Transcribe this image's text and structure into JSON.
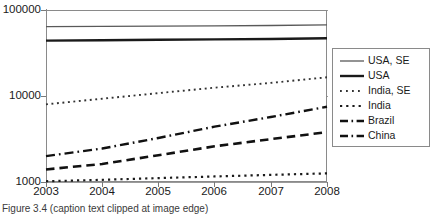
{
  "chart_data": {
    "type": "line",
    "title": "",
    "xlabel": "",
    "ylabel": "",
    "x": [
      2003,
      2004,
      2005,
      2006,
      2007,
      2008
    ],
    "xlim": [
      2003,
      2008
    ],
    "ylim": [
      1000,
      100000
    ],
    "yscale": "log",
    "ytick_labels": [
      "1000",
      "10000",
      "100000"
    ],
    "ytick_values": [
      1000,
      10000,
      100000
    ],
    "xtick_labels": [
      "2003",
      "2004",
      "2005",
      "2006",
      "2007",
      "2008"
    ],
    "grid": true,
    "legend_position": "right",
    "series": [
      {
        "name": "USA, SE",
        "style": "solid-thin",
        "color": "#595959",
        "values": [
          64000,
          64500,
          65000,
          65500,
          66000,
          67000
        ]
      },
      {
        "name": "USA",
        "style": "solid-thick",
        "color": "#1a1a1a",
        "values": [
          44000,
          44500,
          45000,
          45500,
          46000,
          47000
        ]
      },
      {
        "name": "India, SE",
        "style": "dotted-fine",
        "color": "#333333",
        "values": [
          8000,
          9300,
          10800,
          12500,
          14200,
          16500
        ]
      },
      {
        "name": "India",
        "style": "dotted",
        "color": "#1a1a1a",
        "values": [
          1020,
          1060,
          1110,
          1160,
          1210,
          1260
        ]
      },
      {
        "name": "Brazil",
        "style": "dash-dot",
        "color": "#111111",
        "values": [
          2000,
          2450,
          3250,
          4400,
          5700,
          7500
        ]
      },
      {
        "name": "China",
        "style": "dashed",
        "color": "#111111",
        "values": [
          1400,
          1620,
          2050,
          2600,
          3150,
          3800
        ]
      }
    ]
  },
  "legend": {
    "items": [
      {
        "label": "USA, SE"
      },
      {
        "label": "USA"
      },
      {
        "label": "India, SE"
      },
      {
        "label": "India"
      },
      {
        "label": "Brazil"
      },
      {
        "label": "China"
      }
    ]
  },
  "caption": {
    "text": "Figure 3.4  (caption text clipped at image edge)"
  }
}
